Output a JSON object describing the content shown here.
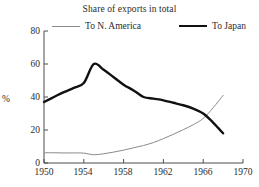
{
  "chart_data": {
    "type": "line",
    "title": "Share of exports in total",
    "xlabel": "",
    "ylabel": "%",
    "xlim": [
      1950,
      1970
    ],
    "ylim": [
      0,
      80
    ],
    "yticks": [
      0,
      20,
      40,
      60,
      80
    ],
    "xticks": [
      1950,
      1954,
      1958,
      1962,
      1966,
      1970
    ],
    "grid": false,
    "legend_position": "top",
    "series": [
      {
        "name": "To N. America",
        "color": "#8a8a8a",
        "linewidth": 1,
        "x": [
          1950,
          1951,
          1952,
          1953,
          1954,
          1955,
          1956,
          1957,
          1958,
          1959,
          1960,
          1961,
          1962,
          1963,
          1964,
          1965,
          1966,
          1967,
          1968
        ],
        "values": [
          6.2,
          6.2,
          6.1,
          6.1,
          6.0,
          5.0,
          5.6,
          6.6,
          7.8,
          9.2,
          10.6,
          12.4,
          14.8,
          17.4,
          20.2,
          23.2,
          27.0,
          33.5,
          41.0
        ]
      },
      {
        "name": "To Japan",
        "color": "#111111",
        "linewidth": 2.4,
        "x": [
          1950,
          1951,
          1952,
          1953,
          1954,
          1955,
          1956,
          1957,
          1958,
          1959,
          1960,
          1961,
          1962,
          1963,
          1964,
          1965,
          1966,
          1967,
          1968
        ],
        "values": [
          37.0,
          40.0,
          43.0,
          45.5,
          48.5,
          60.0,
          56.5,
          52.0,
          47.5,
          44.0,
          40.0,
          39.0,
          38.0,
          36.5,
          35.0,
          33.0,
          30.0,
          24.5,
          18.0
        ]
      }
    ],
    "annotations": []
  },
  "legend": {
    "items": [
      {
        "label": "To N. America"
      },
      {
        "label": "To Japan"
      }
    ]
  },
  "axes": {
    "y_tick_labels": [
      "80",
      "60",
      "40",
      "20",
      "0"
    ],
    "x_tick_labels": [
      "1950",
      "1954",
      "1958",
      "1962",
      "1966",
      "1970"
    ],
    "unit_label": "%"
  },
  "colors": {
    "background": "#ffffff",
    "axis": "#4d4d4d",
    "text": "#2b2b2b",
    "series_namerica": "#8a8a8a",
    "series_japan": "#111111"
  }
}
